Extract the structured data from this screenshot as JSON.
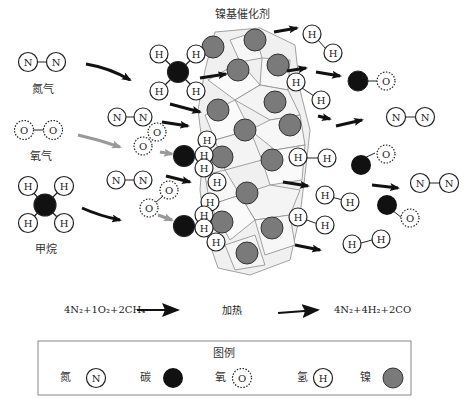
{
  "title": "镍基催化剂",
  "reactant_labels": {
    "nitrogen": "氮气",
    "oxygen": "氧气",
    "methane": "甲烷"
  },
  "atom_symbols": {
    "nitrogen": "N",
    "oxygen": "O",
    "hydrogen": "H"
  },
  "equation": {
    "left": "4N₂+1O₂+2CH₄",
    "condition": "加热",
    "right": "4N₂+4H₂+2CO"
  },
  "legend": {
    "title": "图例",
    "items": [
      {
        "label": "氮",
        "symbol": "N",
        "type": "nitrogen"
      },
      {
        "label": "碳",
        "symbol": "",
        "type": "carbon"
      },
      {
        "label": "氧",
        "symbol": "O",
        "type": "oxygen"
      },
      {
        "label": "氢",
        "symbol": "H",
        "type": "hydrogen"
      },
      {
        "label": "镍",
        "symbol": "",
        "type": "nickel"
      }
    ]
  },
  "colors": {
    "carbon": "#111111",
    "nickel": "#7a7a7a",
    "lattice_fill": "#eeeeee",
    "lattice_stroke": "#888888",
    "arrow_dark": "#111111",
    "arrow_gray": "#999999"
  }
}
